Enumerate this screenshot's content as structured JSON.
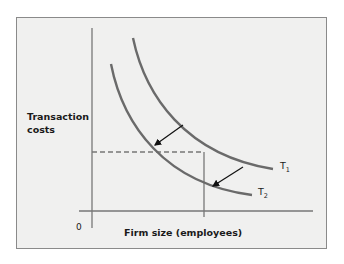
{
  "diagram": {
    "y_axis_label_line1": "Transaction",
    "y_axis_label_line2": "costs",
    "x_axis_label": "Firm size (employees)",
    "origin_label": "0",
    "curves": [
      {
        "name": "T",
        "subscript": "1",
        "description": "Original transaction cost curve"
      },
      {
        "name": "T",
        "subscript": "2",
        "description": "Shifted (lower) transaction cost curve"
      }
    ],
    "arrows": [
      "shift from T1 toward T2 (upper-left)",
      "shift from T1 toward T2 (lower-right)"
    ],
    "reference_lines": [
      "dashed horizontal at constant transaction cost",
      "vertical at firm size"
    ],
    "colors": {
      "background": "#f0f0ef",
      "curve": "#6a6a6a",
      "axis": "#777777",
      "arrow": "#111111",
      "frame_border": "#8a8a8a"
    }
  }
}
